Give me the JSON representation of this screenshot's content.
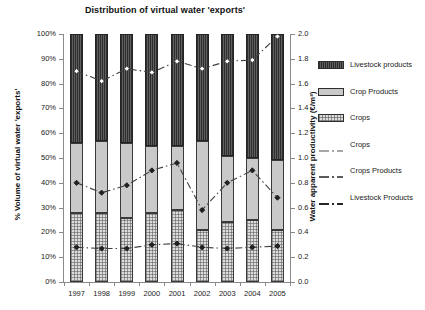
{
  "chart_data": {
    "type": "bar",
    "title": "Distribution of virtual water 'exports'",
    "xlabel": "",
    "ylabel": "% Volume of virtual water 'exports'",
    "y2label": "Water apparent productivity (€/m³)",
    "categories": [
      "1997",
      "1998",
      "1999",
      "2000",
      "2001",
      "2002",
      "2003",
      "2004",
      "2005"
    ],
    "ylim": [
      0,
      100
    ],
    "y2lim": [
      0.0,
      2.0
    ],
    "grid": false,
    "legend_position": "right",
    "stacked": true,
    "ytick_labels": [
      "100%",
      "90%",
      "80%",
      "70%",
      "60%",
      "50%",
      "40%",
      "30%",
      "20%",
      "10%",
      "0%"
    ],
    "ytick_values": [
      100,
      90,
      80,
      70,
      60,
      50,
      40,
      30,
      20,
      10,
      0
    ],
    "y2tick_labels": [
      "2.0",
      "1.8",
      "1.6",
      "1.4",
      "1.2",
      "1.0",
      "0.8",
      "0.6",
      "0.4",
      "0.2",
      "0.0"
    ],
    "y2tick_values": [
      2.0,
      1.8,
      1.6,
      1.4,
      1.2,
      1.0,
      0.8,
      0.6,
      0.4,
      0.2,
      0.0
    ],
    "series": [
      {
        "name": "Crops",
        "axis": "left",
        "kind": "bar",
        "fill": "crops",
        "values": [
          28,
          28,
          26,
          28,
          29,
          21,
          24,
          25,
          21
        ]
      },
      {
        "name": "Crop Products",
        "axis": "left",
        "kind": "bar",
        "fill": "cropproducts",
        "values": [
          28,
          29,
          30,
          27,
          26,
          36,
          27,
          25,
          28
        ]
      },
      {
        "name": "Livestock products",
        "axis": "left",
        "kind": "bar",
        "fill": "livestock",
        "values": [
          44,
          43,
          44,
          45,
          45,
          43,
          49,
          50,
          51
        ]
      },
      {
        "name": "Crops",
        "axis": "right",
        "kind": "line",
        "marker": "diamond-open",
        "values": [
          1.7,
          1.62,
          1.72,
          1.69,
          1.78,
          1.72,
          1.78,
          1.79,
          1.98
        ]
      },
      {
        "name": "Crops Products",
        "axis": "right",
        "kind": "line",
        "marker": "diamond-filled",
        "values": [
          0.8,
          0.72,
          0.78,
          0.9,
          0.96,
          0.58,
          0.8,
          0.9,
          0.68
        ]
      },
      {
        "name": "Livestock Products",
        "axis": "right",
        "kind": "line",
        "marker": "diamond-filled",
        "values": [
          0.28,
          0.27,
          0.27,
          0.3,
          0.31,
          0.28,
          0.27,
          0.28,
          0.29
        ]
      }
    ]
  },
  "legend": {
    "items": [
      {
        "label": "Livestock products",
        "key": "livestock"
      },
      {
        "label": "Crop Products",
        "key": "cropproducts"
      },
      {
        "label": "Crops",
        "key": "cropsfill"
      },
      {
        "label": "Crops",
        "key": "line-crops"
      },
      {
        "label": "Crops Products",
        "key": "line-cropproducts"
      },
      {
        "label": "Livestock Products",
        "key": "line-livestock"
      }
    ]
  }
}
